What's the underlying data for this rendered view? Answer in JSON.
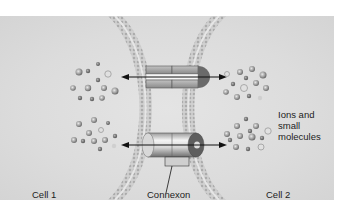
{
  "diagram": {
    "labels": {
      "cell1": "Cell 1",
      "cell2": "Cell 2",
      "connexon": "Connexon",
      "ions_line1": "Ions and",
      "ions_line2": "small",
      "ions_line3": "molecules"
    },
    "structures": [
      "membrane-bilayer-left",
      "membrane-bilayer-right",
      "connexon-upper-cutaway",
      "connexon-lower",
      "arrow-upper",
      "arrow-lower",
      "molecule-cluster-top-left",
      "molecule-cluster-bottom-left",
      "molecule-cluster-top-right",
      "molecule-cluster-bottom-right"
    ],
    "colors": {
      "background": "#dcdcdc",
      "membrane": "#b8b8b8",
      "connexon_light": "#f0f0f0",
      "connexon_dark": "#7a7a7a",
      "arrow": "#111111",
      "molecule": "#9a9a9a"
    }
  }
}
